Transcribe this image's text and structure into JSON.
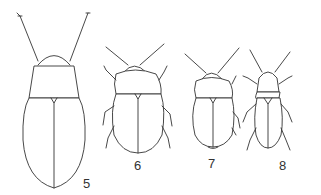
{
  "figure": {
    "labels": [
      "5",
      "6",
      "7",
      "8"
    ]
  }
}
